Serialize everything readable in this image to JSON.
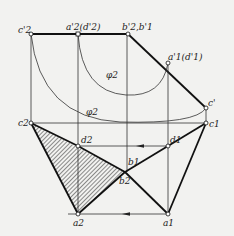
{
  "diagram": {
    "type": "descriptive-geometry-projection",
    "labels": {
      "c2_prime": "c'2",
      "a2_prime_d2_prime": "a'2(d'2)",
      "b2_prime_b1_prime": "b'2,b'1",
      "a1_prime_d1_prime": "a'1(d'1)",
      "c_prime": "c'",
      "phi2_upper": "φ2",
      "phi2_lower": "φ2",
      "c2": "c2",
      "c1": "c1",
      "d2": "d2",
      "d1": "d1",
      "b1": "b1",
      "b2": "b2",
      "a2": "a2",
      "a1": "a1"
    },
    "colors": {
      "background": "#f2f2f0",
      "line": "#111111",
      "hatch": "#222222"
    }
  }
}
